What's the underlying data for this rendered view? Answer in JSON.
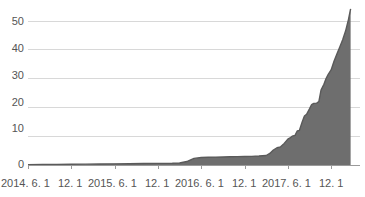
{
  "chart_data": {
    "type": "area",
    "title": "",
    "subtitle": "",
    "xlabel": "",
    "ylabel": "",
    "grid": true,
    "legend": false,
    "xlim": [
      0,
      46
    ],
    "ylim": [
      0,
      57
    ],
    "yticks": [
      0,
      10,
      20,
      30,
      40,
      50
    ],
    "ytick_labels": [
      "0",
      "10",
      "20",
      "30",
      "40",
      "50"
    ],
    "xticks": [
      0,
      6,
      12,
      18,
      24,
      30,
      36,
      42
    ],
    "xtick_labels": [
      "2014. 6. 1",
      "12. 1",
      "2015. 6. 1",
      "12. 1",
      "2016. 6. 1",
      "12. 1",
      "2017. 6. 1",
      "12. 1"
    ],
    "area_color": "#6e6e6e",
    "line_color": "#5a5a5a",
    "grid_color": "#d8d8d8",
    "axis_color": "#9a9a9a",
    "text_color": "#555555",
    "background": "#ffffff",
    "series": [
      {
        "name": "value",
        "x": [
          0,
          2,
          4,
          6,
          8,
          10,
          12,
          14,
          16,
          18,
          20,
          21,
          22,
          23,
          24,
          25,
          26,
          27,
          28,
          29,
          30,
          31,
          32,
          33,
          33.5,
          34,
          34.5,
          35,
          35.5,
          36,
          36.3,
          36.6,
          37,
          37.3,
          37.6,
          38,
          38.3,
          38.6,
          39,
          39.3,
          39.6,
          40,
          40.3,
          40.6,
          41,
          41.3,
          41.6,
          42,
          42.4,
          42.8,
          43.2,
          43.6,
          44,
          44.2,
          44.4,
          44.6,
          44.7
        ],
        "values": [
          0.1,
          0.15,
          0.2,
          0.25,
          0.3,
          0.35,
          0.4,
          0.45,
          0.5,
          0.55,
          0.6,
          0.7,
          1.2,
          2.3,
          2.6,
          2.7,
          2.75,
          2.8,
          2.85,
          2.9,
          2.95,
          3.0,
          3.1,
          3.3,
          4.0,
          5.2,
          6.0,
          6.3,
          7.5,
          9.0,
          9.4,
          10.0,
          10.3,
          11.8,
          12.0,
          15.0,
          17.0,
          17.6,
          19.5,
          21.0,
          21.4,
          21.5,
          22.0,
          26.0,
          28.0,
          30.0,
          31.5,
          33.0,
          36.0,
          38.5,
          41.0,
          43.5,
          46.5,
          48.5,
          50.5,
          53.0,
          54.2
        ]
      }
    ]
  },
  "axes": {
    "y_labels": [
      {
        "text": "50",
        "top": 15
      },
      {
        "text": "40",
        "top": 42
      },
      {
        "text": "30",
        "top": 69
      },
      {
        "text": "20",
        "top": 96
      },
      {
        "text": "10",
        "top": 122
      },
      {
        "text": "0",
        "top": 158
      }
    ],
    "x_labels": [
      {
        "text": "2014. 6. 1",
        "left": 1
      },
      {
        "text": "12. 1",
        "left": 58
      },
      {
        "text": "2015. 6. 1",
        "left": 88
      },
      {
        "text": "12. 1",
        "left": 145
      },
      {
        "text": "2016. 6. 1",
        "left": 175
      },
      {
        "text": "12. 1",
        "left": 232
      },
      {
        "text": "2017. 6. 1",
        "left": 262
      },
      {
        "text": "12. 1",
        "left": 319
      }
    ]
  }
}
